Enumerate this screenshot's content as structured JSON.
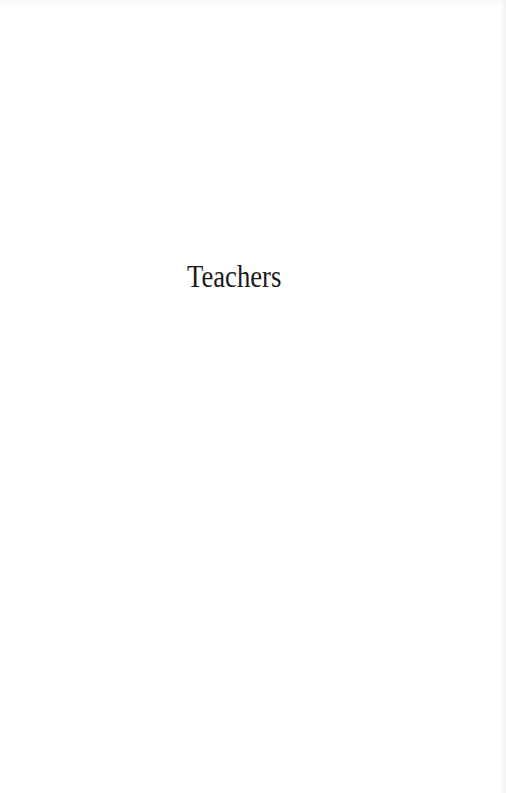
{
  "page": {
    "title": "Teachers",
    "colors": {
      "background": "#ffffff",
      "text": "#1a1a1a"
    }
  }
}
